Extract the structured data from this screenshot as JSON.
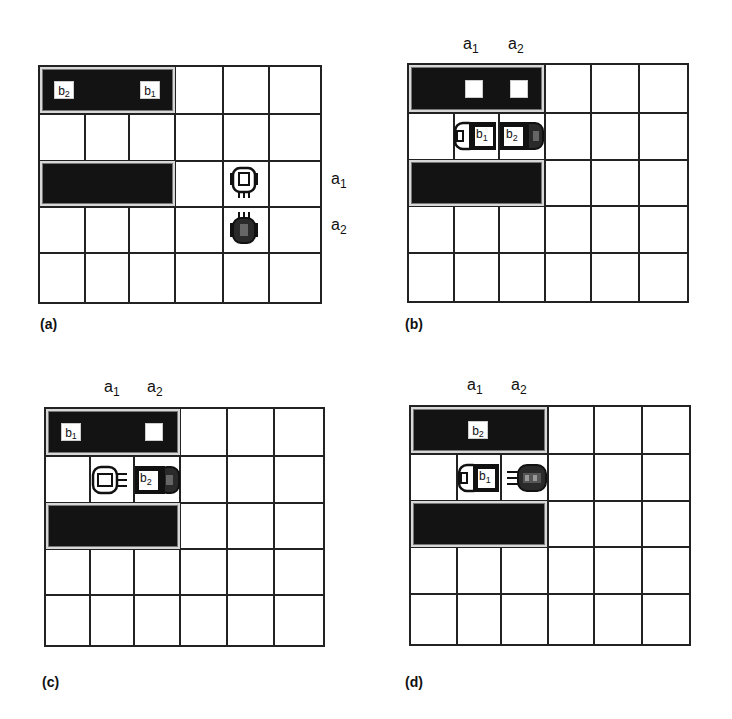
{
  "figure": {
    "grid": {
      "columns": 6,
      "rows": 5
    },
    "colors": {
      "shelf": "#131313",
      "grid_line": "#222222",
      "background": "#ffffff"
    },
    "panels": [
      {
        "id": "a",
        "label": "(a)",
        "shelves": [
          {
            "row": 0,
            "col_start": 0,
            "col_end": 2
          },
          {
            "row": 2,
            "col_start": 0,
            "col_end": 2
          }
        ],
        "boxes": [
          {
            "label": "b",
            "sub": "2",
            "row": 0,
            "col": 0
          },
          {
            "label": "b",
            "sub": "1",
            "row": 0,
            "col": 2
          }
        ],
        "robots": [
          {
            "name": "a",
            "sub": "1",
            "style": "white",
            "row": 2,
            "col": 4,
            "facing": "down",
            "carrying": null
          },
          {
            "name": "a",
            "sub": "2",
            "style": "dark",
            "row": 3,
            "col": 4,
            "facing": "up",
            "carrying": null
          }
        ],
        "side_labels": [
          {
            "text": "a",
            "sub": "1",
            "row": 2
          },
          {
            "text": "a",
            "sub": "2",
            "row": 3
          }
        ]
      },
      {
        "id": "b",
        "label": "(b)",
        "shelves": [
          {
            "row": 0,
            "col_start": 0,
            "col_end": 2
          },
          {
            "row": 2,
            "col_start": 0,
            "col_end": 2
          }
        ],
        "empty_slots": [
          {
            "row": 0,
            "col": 1
          },
          {
            "row": 0,
            "col": 2
          }
        ],
        "robots": [
          {
            "name": "a",
            "sub": "1",
            "style": "white",
            "row": 1,
            "col": 1,
            "facing": "right",
            "carrying": "b1"
          },
          {
            "name": "a",
            "sub": "2",
            "style": "dark",
            "row": 1,
            "col": 2,
            "facing": "left",
            "carrying": "b2"
          }
        ],
        "top_labels": [
          {
            "text": "a",
            "sub": "1",
            "col": 1
          },
          {
            "text": "a",
            "sub": "2",
            "col": 2
          }
        ]
      },
      {
        "id": "c",
        "label": "(c)",
        "shelves": [
          {
            "row": 0,
            "col_start": 0,
            "col_end": 2
          },
          {
            "row": 2,
            "col_start": 0,
            "col_end": 2
          }
        ],
        "boxes": [
          {
            "label": "b",
            "sub": "1",
            "row": 0,
            "col": 0
          }
        ],
        "empty_slots": [
          {
            "row": 0,
            "col": 2
          }
        ],
        "robots": [
          {
            "name": "a",
            "sub": "1",
            "style": "white",
            "row": 1,
            "col": 1,
            "facing": "right",
            "carrying": null
          },
          {
            "name": "a",
            "sub": "2",
            "style": "dark",
            "row": 1,
            "col": 2,
            "facing": "left",
            "carrying": "b2"
          }
        ],
        "top_labels": [
          {
            "text": "a",
            "sub": "1",
            "col": 1
          },
          {
            "text": "a",
            "sub": "2",
            "col": 2
          }
        ]
      },
      {
        "id": "d",
        "label": "(d)",
        "shelves": [
          {
            "row": 0,
            "col_start": 0,
            "col_end": 2
          },
          {
            "row": 2,
            "col_start": 0,
            "col_end": 2
          }
        ],
        "boxes": [
          {
            "label": "b",
            "sub": "2",
            "row": 0,
            "col": 1
          }
        ],
        "robots": [
          {
            "name": "a",
            "sub": "1",
            "style": "white",
            "row": 1,
            "col": 1,
            "facing": "right",
            "carrying": "b1"
          },
          {
            "name": "a",
            "sub": "2",
            "style": "dark",
            "row": 1,
            "col": 2,
            "facing": "left",
            "carrying": null
          }
        ],
        "top_labels": [
          {
            "text": "a",
            "sub": "1",
            "col": 1
          },
          {
            "text": "a",
            "sub": "2",
            "col": 2
          }
        ]
      }
    ]
  },
  "text": {
    "a": "a",
    "b": "b",
    "one": "1",
    "two": "2",
    "label_a": "(a)",
    "label_b": "(b)",
    "label_c": "(c)",
    "label_d": "(d)"
  }
}
